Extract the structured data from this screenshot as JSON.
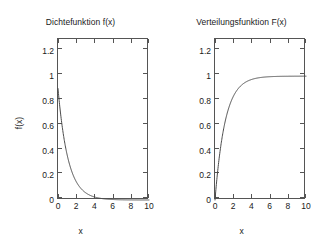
{
  "figure": {
    "background": "#ffffff",
    "line_color": "#4a4a4a",
    "axis_color": "#555555"
  },
  "panels": [
    {
      "title": "Dichtefunktion f(x)",
      "xlabel": "x",
      "ylabel": "f(x)",
      "xticks": [
        "0",
        "2",
        "4",
        "6",
        "8",
        "10"
      ],
      "yticks": [
        "0",
        "0.2",
        "0.4",
        "0.6",
        "0.8",
        "1",
        "1.2"
      ]
    },
    {
      "title": "Verteilungsfunktion F(x)",
      "xlabel": "x",
      "ylabel": "F(x)",
      "xticks": [
        "0",
        "2",
        "4",
        "6",
        "8",
        "10"
      ],
      "yticks": [
        "0",
        "0.2",
        "0.4",
        "0.6",
        "0.8",
        "1",
        "1.2"
      ]
    }
  ],
  "chart_data": [
    {
      "type": "line",
      "title": "Dichtefunktion f(x)",
      "xlabel": "x",
      "ylabel": "f(x)",
      "xlim": [
        0,
        10
      ],
      "ylim": [
        0,
        1.3
      ],
      "xticks": [
        0,
        2,
        4,
        6,
        8,
        10
      ],
      "yticks": [
        0,
        0.2,
        0.4,
        0.6,
        0.8,
        1,
        1.2
      ],
      "grid": false,
      "legend": "none",
      "description": "Exponential probability density function f(x) = 0.9 * exp(-0.9x), decaying from about 0.9 at x=0 to nearly 0 by x=6",
      "series": [
        {
          "name": "f(x)",
          "x": [
            0,
            0.25,
            0.5,
            0.75,
            1,
            1.25,
            1.5,
            1.75,
            2,
            2.5,
            3,
            3.5,
            4,
            4.5,
            5,
            5.5,
            6,
            6.5,
            7,
            7.5,
            8,
            8.5,
            9,
            9.5,
            10
          ],
          "values": [
            0.9,
            0.719,
            0.574,
            0.459,
            0.366,
            0.292,
            0.233,
            0.186,
            0.149,
            0.095,
            0.06,
            0.039,
            0.025,
            0.016,
            0.01,
            0.006,
            0.004,
            0.003,
            0.002,
            0.001,
            0.001,
            0.0004,
            0.0003,
            0.0002,
            0.0001
          ]
        }
      ]
    },
    {
      "type": "line",
      "title": "Verteilungsfunktion F(x)",
      "xlabel": "x",
      "ylabel": "F(x)",
      "xlim": [
        0,
        10
      ],
      "ylim": [
        0,
        1.3
      ],
      "xticks": [
        0,
        2,
        4,
        6,
        8,
        10
      ],
      "yticks": [
        0,
        0.2,
        0.4,
        0.6,
        0.8,
        1,
        1.2
      ],
      "grid": false,
      "legend": "none",
      "description": "Exponential cumulative distribution function F(x) = 1 - exp(-0.9x), rising from 0 at x=0 and approaching the asymptote 1 by about x=5",
      "series": [
        {
          "name": "F(x)",
          "x": [
            0,
            0.25,
            0.5,
            0.75,
            1,
            1.25,
            1.5,
            1.75,
            2,
            2.5,
            3,
            3.5,
            4,
            4.5,
            5,
            5.5,
            6,
            6.5,
            7,
            7.5,
            8,
            8.5,
            9,
            9.5,
            10
          ],
          "values": [
            0,
            0.201,
            0.362,
            0.491,
            0.593,
            0.675,
            0.741,
            0.793,
            0.835,
            0.895,
            0.933,
            0.957,
            0.973,
            0.983,
            0.989,
            0.993,
            0.995,
            0.997,
            0.998,
            0.999,
            0.999,
            0.9995,
            0.9997,
            0.9998,
            0.9999
          ]
        }
      ]
    }
  ]
}
